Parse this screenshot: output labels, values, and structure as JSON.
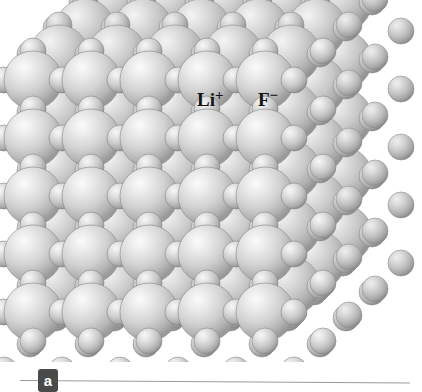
{
  "figure": {
    "name": "lithium-fluoride-crystal-structure",
    "panel_letter": "a",
    "background_color": "#ffffff"
  },
  "labels": {
    "cation": {
      "symbol": "Li",
      "charge": "+",
      "full": "Li+"
    },
    "anion": {
      "symbol": "F",
      "charge": "−",
      "full": "F−"
    }
  },
  "legend_colors": {
    "anion_sphere_light": "#f2f2f2",
    "anion_sphere_mid": "#cfcfcf",
    "anion_sphere_dark": "#9b9b9b",
    "cation_sphere_light": "#ededed",
    "cation_sphere_mid": "#c6c6c6",
    "cation_sphere_dark": "#949494",
    "rule": "#9a9a9a",
    "badge_bg": "#4a4a4a",
    "badge_text": "#ffffff",
    "label_text": "#141414"
  },
  "crystal": {
    "type": "rock-salt",
    "large_ion": "F−",
    "small_ion": "Li+",
    "large_radius_px": 29,
    "small_radius_px": 13,
    "lattice_step_px": 58,
    "depth_offset_x_px": 26,
    "depth_offset_y_px": -26,
    "layers": 4,
    "rows": 5,
    "cols": 5
  }
}
